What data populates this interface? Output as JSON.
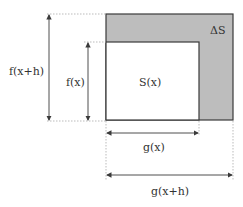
{
  "diagram": {
    "colors": {
      "delta_fill": "#bdbdbd",
      "inner_fill": "#ffffff",
      "stroke": "#3a3a3a",
      "guide": "#aaaaaa",
      "text": "#333333"
    },
    "labels": {
      "delta_s": "ΔS",
      "s_x": "S(x)",
      "f_x": "f(x)",
      "f_xh": "f(x+h)",
      "g_x": "g(x)",
      "g_xh": "g(x+h)"
    }
  }
}
